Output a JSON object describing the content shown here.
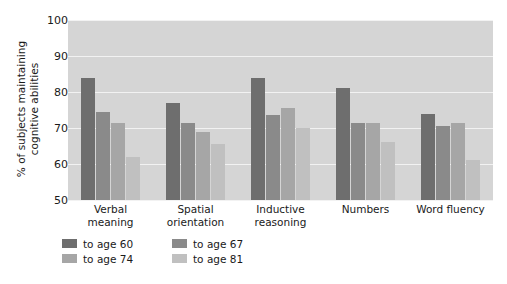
{
  "chart_data": {
    "type": "bar",
    "title": "",
    "xlabel": "",
    "ylabel": "% of subjects maintaining\ncognitive abilities",
    "ylim": [
      50,
      100
    ],
    "yticks": [
      50,
      60,
      70,
      80,
      90,
      100
    ],
    "grid": true,
    "legend_position": "bottom-left",
    "categories": [
      "Verbal\nmeaning",
      "Spatial\norientation",
      "Inductive\nreasoning",
      "Numbers",
      "Word fluency"
    ],
    "series": [
      {
        "name": "to age 60",
        "color": "#6e6e6e",
        "values": [
          84,
          77,
          84,
          81,
          74
        ]
      },
      {
        "name": "to age 67",
        "color": "#8a8a8a",
        "values": [
          74.5,
          71.5,
          73.5,
          71.5,
          70.5
        ]
      },
      {
        "name": "to age 74",
        "color": "#a6a6a6",
        "values": [
          71.5,
          69,
          75.5,
          71.5,
          71.5
        ]
      },
      {
        "name": "to age 81",
        "color": "#c0c0c0",
        "values": [
          62,
          65.5,
          70,
          66,
          61
        ]
      }
    ]
  },
  "colors": {
    "plot_background": "#d5d5d5",
    "gridline": "#f2f2f2",
    "page_background": "#ffffff",
    "text": "#1a1a1a"
  }
}
